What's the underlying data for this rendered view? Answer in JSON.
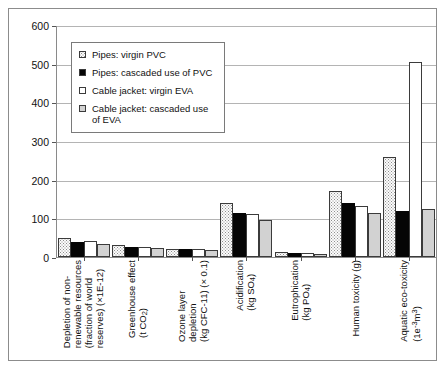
{
  "chart_data": {
    "type": "bar",
    "title": "",
    "xlabel": "",
    "ylabel": "",
    "ylim": [
      0,
      600
    ],
    "ytick_step": 100,
    "yticks": [
      "0",
      "100",
      "200",
      "300",
      "400",
      "500",
      "600"
    ],
    "grid": true,
    "legend_position": "upper-left-inside",
    "categories": [
      "Depletion of non-renewable resources (fraction of world reserves) (x1E-12)",
      "Greenhouse effect (t CO2)",
      "Ozone layer depletion (kg CFC-11) (x 0.1)",
      "Acidification (kg SO4)",
      "Eutrophication (kg PO4)",
      "Human toxicity (g)",
      "Aquatic eco-toxicity (1e-3 m3)"
    ],
    "category_lines": [
      [
        "Depletion of non-",
        "renewable resources",
        "(fraction of world",
        "reserves) (x1E-12)"
      ],
      [
        "Greenhouse effect",
        "(t CO2)"
      ],
      [
        "Ozone layer",
        "depletion",
        "(kg CFC-11) (x 0.1)"
      ],
      [
        "Acidification",
        "(kg SO4)"
      ],
      [
        "Eutrophication",
        "(kg PO4)"
      ],
      [
        "Human toxicity (g)"
      ],
      [
        "Aquatic eco-toxicity",
        "(1e-3 m3)"
      ]
    ],
    "series": [
      {
        "name": "Pipes: virgin PVC",
        "pattern": "dotted",
        "values": [
          48,
          30,
          22,
          140,
          12,
          170,
          258
        ]
      },
      {
        "name": "Pipes: cascaded use of PVC",
        "pattern": "solid-black",
        "values": [
          40,
          27,
          20,
          115,
          10,
          140,
          120
        ]
      },
      {
        "name": "Cable jacket: virgin EVA",
        "pattern": "white",
        "values": [
          42,
          26,
          21,
          112,
          11,
          132,
          505
        ]
      },
      {
        "name": "Cable jacket: cascaded use of EVA",
        "pattern": "light-gray",
        "values": [
          33,
          24,
          18,
          95,
          8,
          115,
          125
        ]
      }
    ]
  },
  "legend": {
    "items": [
      {
        "label": "Pipes: virgin PVC",
        "swatch": "dotted"
      },
      {
        "label": "Pipes: cascaded use of PVC",
        "swatch": "solid-black"
      },
      {
        "label": "Cable jacket: virgin EVA",
        "swatch": "white"
      },
      {
        "label": "Cable jacket: cascaded use of EVA",
        "swatch": "light-gray"
      }
    ]
  },
  "colors": {
    "frame": "#8c8c8c",
    "axis": "#8a8a8a",
    "gridline": "#b4b4b4",
    "series_dotted": "#fbfbfb",
    "series_black": "#050505",
    "series_white": "#ffffff",
    "series_gray": "#d2d2d2",
    "text": "#111111"
  }
}
